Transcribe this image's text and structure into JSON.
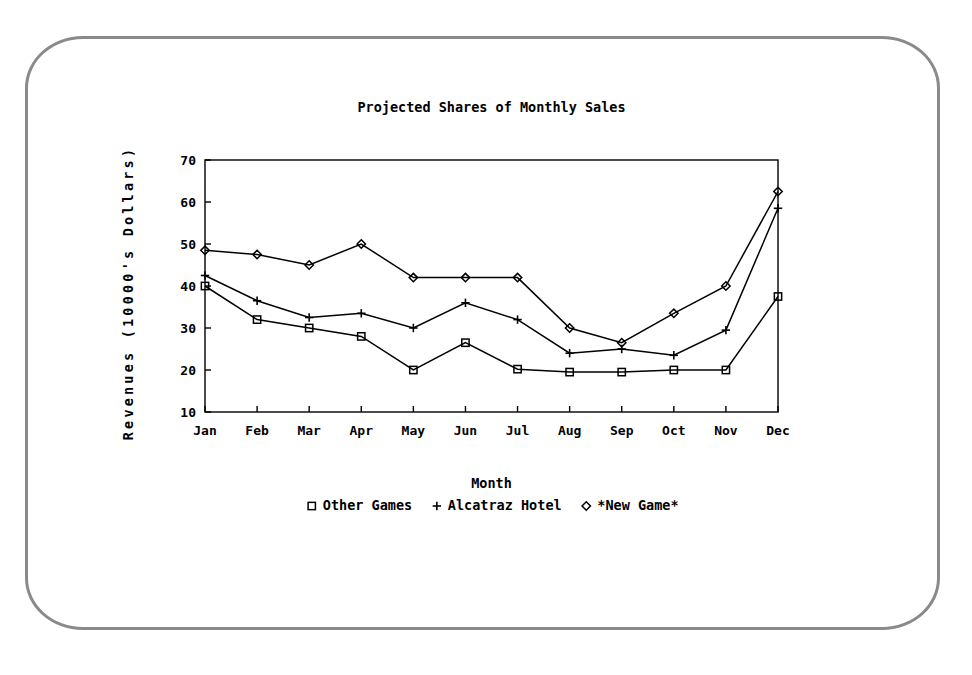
{
  "frame": {
    "border_color": "#8a8a8a",
    "shape": "rounded-rectangle-bezel"
  },
  "chart_data": {
    "type": "line",
    "title": "Projected Shares of Monthly Sales",
    "xlabel": "Month",
    "ylabel": "Revenues (10000's Dollars)",
    "categories": [
      "Jan",
      "Feb",
      "Mar",
      "Apr",
      "May",
      "Jun",
      "Jul",
      "Aug",
      "Sep",
      "Oct",
      "Nov",
      "Dec"
    ],
    "x_tick_labels": [
      "Jan",
      "Feb",
      "Mar",
      "Apr",
      "May",
      "Jun",
      "Jul",
      "Aug",
      "Sep",
      "Oct",
      "Nov",
      "Dec"
    ],
    "y_tick_labels": [
      "10",
      "20",
      "30",
      "40",
      "50",
      "60",
      "70"
    ],
    "y_ticks": [
      10,
      20,
      30,
      40,
      50,
      60,
      70
    ],
    "ylim": [
      10,
      70
    ],
    "grid": false,
    "legend_position": "bottom",
    "line_color": "#000000",
    "series": [
      {
        "name": "Other Games",
        "marker": "square",
        "marker_glyph": "□",
        "values": [
          40,
          32,
          30,
          28,
          20,
          26.5,
          20.2,
          19.5,
          19.5,
          20,
          20,
          37.5
        ]
      },
      {
        "name": "Alcatraz Hotel",
        "marker": "plus",
        "marker_glyph": "+",
        "values": [
          42.5,
          36.5,
          32.5,
          33.5,
          30,
          36,
          32,
          24,
          25,
          23.5,
          29.5,
          58.5
        ]
      },
      {
        "name": "*New Game*",
        "marker": "diamond",
        "marker_glyph": "◇",
        "values": [
          48.5,
          47.5,
          45,
          50,
          42,
          42,
          42,
          30,
          26.5,
          33.5,
          40,
          62.5
        ]
      }
    ]
  }
}
